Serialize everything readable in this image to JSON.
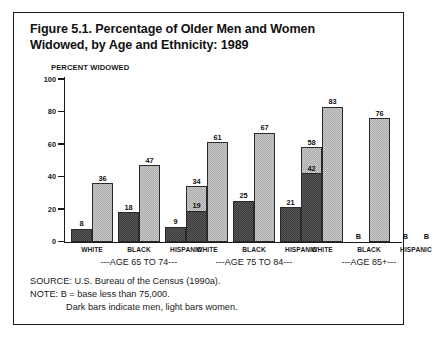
{
  "figure": {
    "title_line1": "Figure 5.1. Percentage of Older Men and Women",
    "title_line2": "Widowed, by Age and Ethnicity: 1989",
    "axis_caption": "PERCENT WIDOWED"
  },
  "footer": {
    "source": "SOURCE: U.S. Bureau of the Census (1990a).",
    "note": "NOTE: B = base less than 75,000.",
    "note2": "Dark bars indicate men, light bars women."
  },
  "chart_data": {
    "type": "bar",
    "title": "Figure 5.1. Percentage of Older Men and Women Widowed, by Age and Ethnicity: 1989",
    "xlabel": "",
    "ylabel": "PERCENT WIDOWED",
    "ylim": [
      0,
      100
    ],
    "yticks": [
      0,
      20,
      40,
      60,
      80,
      100
    ],
    "grid": false,
    "legend": "Dark bars indicate men, light bars women.",
    "categories": [
      "WHITE",
      "BLACK",
      "HISPANIC"
    ],
    "groups": [
      {
        "label": "---AGE 65 TO 74---",
        "bars": [
          {
            "ethnicity": "WHITE",
            "men": 8,
            "women": 36,
            "men_label": "8",
            "women_label": "36"
          },
          {
            "ethnicity": "BLACK",
            "men": 18,
            "women": 47,
            "men_label": "18",
            "women_label": "47"
          },
          {
            "ethnicity": "HISPANIC",
            "men": 9,
            "women": 34,
            "men_label": "9",
            "women_label": "34"
          }
        ]
      },
      {
        "label": "---AGE 75 TO 84---",
        "bars": [
          {
            "ethnicity": "WHITE",
            "men": 19,
            "women": 61,
            "men_label": "19",
            "women_label": "61"
          },
          {
            "ethnicity": "BLACK",
            "men": 25,
            "women": 67,
            "men_label": "25",
            "women_label": "67"
          },
          {
            "ethnicity": "HISPANIC",
            "men": 21,
            "women": 58,
            "men_label": "21",
            "women_label": "58"
          }
        ]
      },
      {
        "label": "---AGE 85+---",
        "bars": [
          {
            "ethnicity": "WHITE",
            "men": 42,
            "women": 83,
            "men_label": "42",
            "women_label": "83"
          },
          {
            "ethnicity": "BLACK",
            "men": null,
            "women": 76,
            "men_label": "B",
            "women_label": "76"
          },
          {
            "ethnicity": "HISPANIC",
            "men": null,
            "women": null,
            "men_label": "B",
            "women_label": "B"
          }
        ]
      }
    ]
  },
  "colors": {
    "men_bar": "#59595b",
    "women_bar": "#c9c9c9",
    "axis": "#1a1a1a",
    "frame": "#1a1a1a",
    "background": "#ffffff"
  }
}
